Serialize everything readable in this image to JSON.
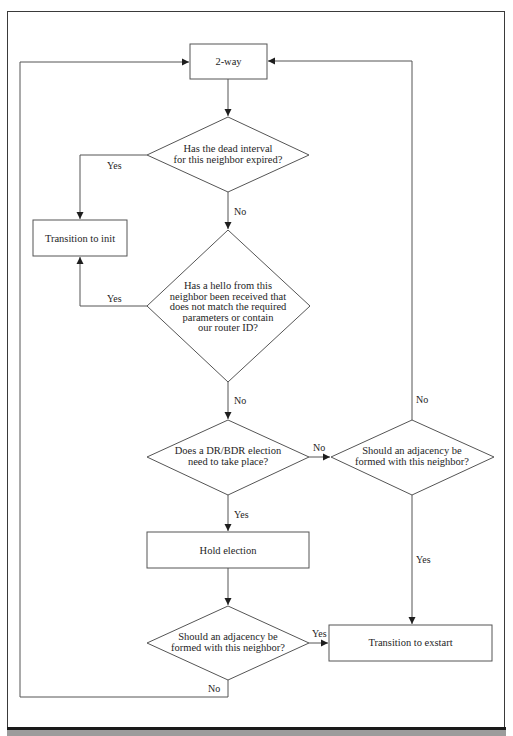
{
  "diagram": {
    "type": "flowchart",
    "colors": {
      "line": "#555555",
      "frame": "#3a3a3a",
      "bottom_bar": "#9c9c9c",
      "text": "#1e1e1e"
    },
    "nodes": {
      "two_way": {
        "shape": "rect",
        "label": "2-way"
      },
      "dead_interval": {
        "shape": "diamond",
        "lines": [
          "Has the dead interval",
          "for this neighbor expired?"
        ]
      },
      "transition_init": {
        "shape": "rect",
        "label": "Transition to init"
      },
      "hello_mismatch": {
        "shape": "diamond",
        "lines": [
          "Has a hello from this",
          "neighbor been received that",
          "does not match the required",
          "parameters or contain",
          "our router ID?"
        ]
      },
      "dr_bdr_election": {
        "shape": "diamond",
        "lines": [
          "Does a DR/BDR election",
          "need to take place?"
        ]
      },
      "adjacency_right": {
        "shape": "diamond",
        "lines": [
          "Should an adjacency be",
          "formed with this neighbor?"
        ]
      },
      "hold_election": {
        "shape": "rect",
        "label": "Hold election"
      },
      "adjacency_bottom": {
        "shape": "diamond",
        "lines": [
          "Should an adjacency be",
          "formed with this neighbor?"
        ]
      },
      "transition_exstart": {
        "shape": "rect",
        "label": "Transition to exstart"
      }
    },
    "edges": [
      {
        "from": "two_way",
        "to": "dead_interval",
        "label": ""
      },
      {
        "from": "dead_interval",
        "to": "transition_init",
        "label": "Yes"
      },
      {
        "from": "dead_interval",
        "to": "hello_mismatch",
        "label": "No"
      },
      {
        "from": "hello_mismatch",
        "to": "transition_init",
        "label": "Yes"
      },
      {
        "from": "hello_mismatch",
        "to": "dr_bdr_election",
        "label": "No"
      },
      {
        "from": "dr_bdr_election",
        "to": "adjacency_right",
        "label": "No"
      },
      {
        "from": "dr_bdr_election",
        "to": "hold_election",
        "label": "Yes"
      },
      {
        "from": "adjacency_right",
        "to": "two_way",
        "label": "No"
      },
      {
        "from": "adjacency_right",
        "to": "transition_exstart",
        "label": "Yes"
      },
      {
        "from": "hold_election",
        "to": "adjacency_bottom",
        "label": ""
      },
      {
        "from": "adjacency_bottom",
        "to": "transition_exstart",
        "label": "Yes"
      },
      {
        "from": "adjacency_bottom",
        "to": "two_way",
        "label": "No"
      }
    ],
    "edge_labels": {
      "dead_yes": "Yes",
      "dead_no": "No",
      "hello_yes": "Yes",
      "hello_no": "No",
      "dr_no": "No",
      "dr_yes": "Yes",
      "adj_right_no": "No",
      "adj_right_yes": "Yes",
      "adj_bottom_yes": "Yes",
      "adj_bottom_no": "No"
    }
  }
}
